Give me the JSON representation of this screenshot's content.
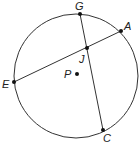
{
  "diagram": {
    "type": "circle-chords",
    "circle": {
      "center_label": "P",
      "cx": 76,
      "cy": 76,
      "r": 62
    },
    "points": [
      {
        "label": "G",
        "x": 80,
        "y": 14,
        "lx": 75,
        "ly": 10
      },
      {
        "label": "A",
        "x": 121,
        "y": 31,
        "lx": 124,
        "ly": 30
      },
      {
        "label": "E",
        "x": 14,
        "y": 82,
        "lx": 2,
        "ly": 88
      },
      {
        "label": "C",
        "x": 103,
        "y": 130,
        "lx": 103,
        "ly": 142
      },
      {
        "label": "J",
        "x": 87,
        "y": 48,
        "lx": 79,
        "ly": 63
      },
      {
        "label": "P",
        "x": 77,
        "y": 74,
        "lx": 64,
        "ly": 78
      }
    ],
    "chords": [
      [
        "E",
        "A"
      ],
      [
        "G",
        "C"
      ]
    ],
    "stroke_color": "#333333"
  }
}
